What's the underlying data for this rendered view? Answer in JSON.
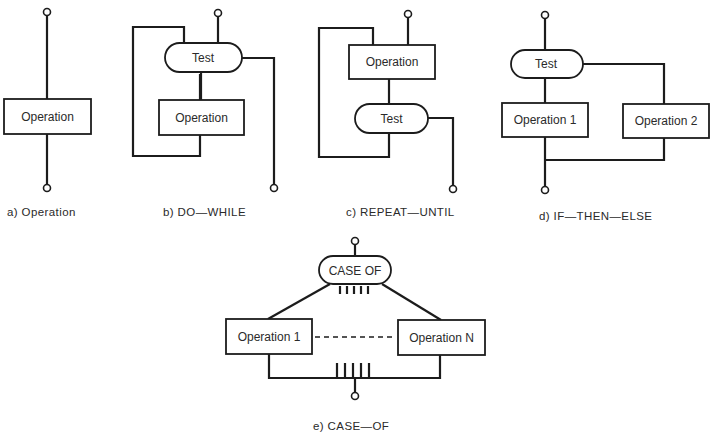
{
  "diagrams": {
    "a": {
      "caption": "a) Operation",
      "operation": "Operation"
    },
    "b": {
      "caption": "b) DO—WHILE",
      "test": "Test",
      "operation": "Operation"
    },
    "c": {
      "caption": "c) REPEAT—UNTIL",
      "operation": "Operation",
      "test": "Test"
    },
    "d": {
      "caption": "d) IF—THEN—ELSE",
      "test": "Test",
      "operation1": "Operation 1",
      "operation2": "Operation 2"
    },
    "e": {
      "caption": "e) CASE—OF",
      "case": "CASE OF",
      "operation1": "Operation 1",
      "operationN": "Operation N"
    }
  },
  "colors": {
    "line": "#1c1c1c",
    "background": "#ffffff"
  }
}
